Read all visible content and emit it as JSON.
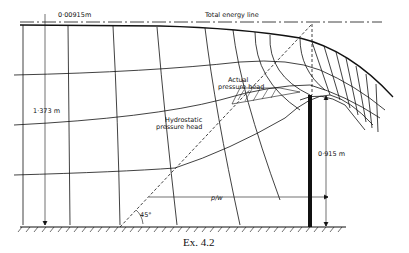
{
  "figure": {
    "caption": "Ex. 4.2",
    "labels": {
      "energy_gap": "0·00915m",
      "total_energy_line": "Total energy line",
      "upstream_depth": "1·373 m",
      "actual_pressure_head_1": "Actual",
      "actual_pressure_head_2": "pressure head",
      "hydrostatic_pressure_head_1": "Hydrostatic",
      "hydrostatic_pressure_head_2": "pressure head",
      "weir_height": "0·915 m",
      "p_over_w": "p/w",
      "angle": "45°"
    },
    "colors": {
      "ink": "#111111",
      "background": "#ffffff"
    }
  }
}
